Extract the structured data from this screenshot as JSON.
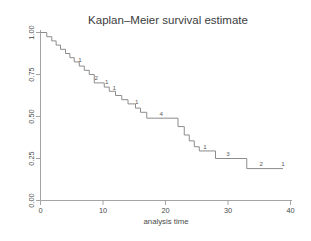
{
  "chart_data": {
    "type": "line",
    "subtype": "kaplan-meier-step",
    "title": "Kaplan–Meier survival estimate",
    "xlabel": "analysis time",
    "ylabel": "",
    "xlim": [
      0,
      40
    ],
    "ylim": [
      0.0,
      1.0
    ],
    "grid": false,
    "legend": null,
    "xticks": [
      0,
      10,
      20,
      30,
      40
    ],
    "xticklabels": [
      "0",
      "10",
      "20",
      "30",
      "40"
    ],
    "yticks": [
      0.0,
      0.25,
      0.5,
      0.75,
      1.0
    ],
    "yticklabels": [
      "0.00",
      "0.25",
      "0.50",
      "0.75",
      "1.00"
    ],
    "ytick_rotation": 90,
    "line_color": "#8c8c8c",
    "axis_color": "#9a9a9a",
    "series": [
      {
        "name": "survival",
        "steps": [
          {
            "t": 0.0,
            "s": 1.0
          },
          {
            "t": 1.0,
            "s": 1.0
          },
          {
            "t": 1.0,
            "s": 0.975
          },
          {
            "t": 1.8,
            "s": 0.975
          },
          {
            "t": 1.8,
            "s": 0.95
          },
          {
            "t": 2.5,
            "s": 0.95
          },
          {
            "t": 2.5,
            "s": 0.925
          },
          {
            "t": 3.2,
            "s": 0.925
          },
          {
            "t": 3.2,
            "s": 0.9
          },
          {
            "t": 4.0,
            "s": 0.9
          },
          {
            "t": 4.0,
            "s": 0.875
          },
          {
            "t": 4.7,
            "s": 0.875
          },
          {
            "t": 4.7,
            "s": 0.85
          },
          {
            "t": 5.4,
            "s": 0.85
          },
          {
            "t": 5.4,
            "s": 0.825
          },
          {
            "t": 6.2,
            "s": 0.825
          },
          {
            "t": 6.2,
            "s": 0.8
          },
          {
            "t": 7.0,
            "s": 0.8
          },
          {
            "t": 7.0,
            "s": 0.775
          },
          {
            "t": 7.8,
            "s": 0.775
          },
          {
            "t": 7.8,
            "s": 0.75
          },
          {
            "t": 8.6,
            "s": 0.75
          },
          {
            "t": 8.6,
            "s": 0.7
          },
          {
            "t": 10.2,
            "s": 0.7
          },
          {
            "t": 10.2,
            "s": 0.675
          },
          {
            "t": 11.0,
            "s": 0.675
          },
          {
            "t": 11.0,
            "s": 0.65
          },
          {
            "t": 12.0,
            "s": 0.65
          },
          {
            "t": 12.0,
            "s": 0.625
          },
          {
            "t": 13.0,
            "s": 0.625
          },
          {
            "t": 13.0,
            "s": 0.6
          },
          {
            "t": 14.0,
            "s": 0.6
          },
          {
            "t": 14.0,
            "s": 0.575
          },
          {
            "t": 15.2,
            "s": 0.575
          },
          {
            "t": 15.2,
            "s": 0.55
          },
          {
            "t": 16.0,
            "s": 0.55
          },
          {
            "t": 16.0,
            "s": 0.525
          },
          {
            "t": 17.0,
            "s": 0.525
          },
          {
            "t": 17.0,
            "s": 0.49
          },
          {
            "t": 22.0,
            "s": 0.49
          },
          {
            "t": 22.0,
            "s": 0.44
          },
          {
            "t": 23.0,
            "s": 0.44
          },
          {
            "t": 23.0,
            "s": 0.39
          },
          {
            "t": 23.8,
            "s": 0.39
          },
          {
            "t": 23.8,
            "s": 0.355
          },
          {
            "t": 24.6,
            "s": 0.355
          },
          {
            "t": 24.6,
            "s": 0.32
          },
          {
            "t": 25.4,
            "s": 0.32
          },
          {
            "t": 25.4,
            "s": 0.295
          },
          {
            "t": 28.0,
            "s": 0.295
          },
          {
            "t": 28.0,
            "s": 0.25
          },
          {
            "t": 33.0,
            "s": 0.25
          },
          {
            "t": 33.0,
            "s": 0.19
          },
          {
            "t": 38.8,
            "s": 0.19
          }
        ]
      }
    ],
    "censor_annotations": [
      {
        "label": "1",
        "t": 6.3,
        "s": 0.825
      },
      {
        "label": "2",
        "t": 8.9,
        "s": 0.715
      },
      {
        "label": "1",
        "t": 10.6,
        "s": 0.695
      },
      {
        "label": "1",
        "t": 11.8,
        "s": 0.655
      },
      {
        "label": "1",
        "t": 15.4,
        "s": 0.575
      },
      {
        "label": "4",
        "t": 19.3,
        "s": 0.505
      },
      {
        "label": "1",
        "t": 26.3,
        "s": 0.305
      },
      {
        "label": "3",
        "t": 30.0,
        "s": 0.265
      },
      {
        "label": "2",
        "t": 35.3,
        "s": 0.205
      },
      {
        "label": "1",
        "t": 38.8,
        "s": 0.205
      }
    ]
  }
}
